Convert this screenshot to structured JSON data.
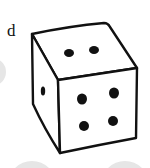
{
  "figure": {
    "label": "d",
    "faces": {
      "top": {
        "pips": 2
      },
      "front": {
        "pips": 4
      },
      "left": {
        "pips": 1
      }
    },
    "colors": {
      "outline": "#111111",
      "face": "#ffffff",
      "background_circles": "#e6e6e6"
    }
  }
}
